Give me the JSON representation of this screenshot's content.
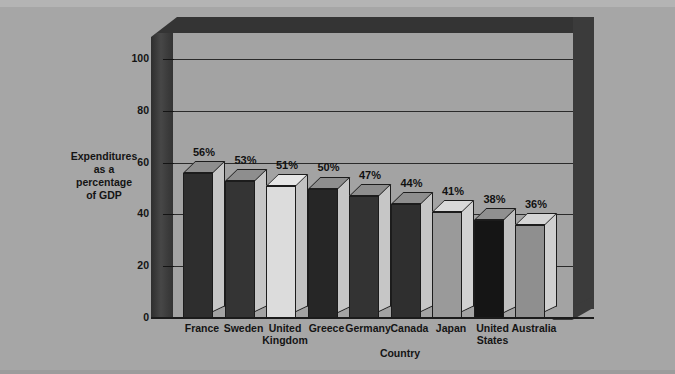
{
  "chart_data": {
    "type": "bar",
    "title": "",
    "xlabel": "Country",
    "ylabel": "Expenditures as a percentage of GDP",
    "ylabel_lines": [
      "Expenditures",
      "as a",
      "percentage",
      "of GDP"
    ],
    "categories": [
      "France",
      "Sweden",
      "United Kingdom",
      "Greece",
      "Germany",
      "Canada",
      "Japan",
      "United States",
      "Australia"
    ],
    "category_lines": [
      [
        "France"
      ],
      [
        "Sweden"
      ],
      [
        "United",
        "Kingdom"
      ],
      [
        "Greece"
      ],
      [
        "Germany"
      ],
      [
        "Canada"
      ],
      [
        "Japan"
      ],
      [
        "United",
        "States"
      ],
      [
        "Australia"
      ]
    ],
    "values": [
      56,
      53,
      51,
      50,
      47,
      44,
      41,
      38,
      36
    ],
    "data_labels": [
      "56%",
      "53%",
      "51%",
      "50%",
      "47%",
      "44%",
      "41%",
      "38%",
      "36%"
    ],
    "bar_colors": [
      "#2e2e2e",
      "#343434",
      "#dcdcdc",
      "#262626",
      "#333333",
      "#2f2f2f",
      "#9a9a9a",
      "#151515",
      "#8f8f8f"
    ],
    "bar_top_colors": [
      "#8e8e8e",
      "#8e8e8e",
      "#e6e6e6",
      "#8e8e8e",
      "#8e8e8e",
      "#8e8e8e",
      "#d9d9d9",
      "#909090",
      "#d4d4d4"
    ],
    "bar_side_colors": [
      "#c6c6c6",
      "#c6c6c6",
      "#c2c2c2",
      "#c6c6c6",
      "#c6c6c6",
      "#c6c6c6",
      "#d2d2d2",
      "#c0c0c0",
      "#cfcfcf"
    ],
    "ylim": [
      0,
      110
    ],
    "yticks": [
      0,
      20,
      40,
      60,
      80,
      100
    ],
    "ytick_labels": [
      "0",
      "20",
      "40",
      "60",
      "80",
      "100"
    ],
    "gridlines": [
      20,
      40,
      60,
      80,
      100
    ],
    "grid": true,
    "legend": "none",
    "style_3d": true,
    "colors": {
      "page_background": "#a6a6a6",
      "plot_background": "#a3a3a3",
      "frame": "#343434",
      "gridline": "#2a2a2a",
      "text": "#141414"
    }
  }
}
